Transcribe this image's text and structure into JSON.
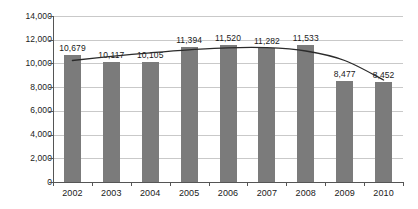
{
  "chart_data": {
    "type": "bar",
    "title": "",
    "xlabel": "",
    "ylabel": "",
    "categories": [
      "2002",
      "2003",
      "2004",
      "2005",
      "2006",
      "2007",
      "2008",
      "2009",
      "2010"
    ],
    "values": [
      10679,
      10117,
      10105,
      11394,
      11520,
      11282,
      11533,
      8477,
      8452
    ],
    "value_labels": [
      "10,679",
      "10,117",
      "10,105",
      "11,394",
      "11,520",
      "11,282",
      "11,533",
      "8,477",
      "8,452"
    ],
    "ylim": [
      0,
      14000
    ],
    "ytick_values": [
      14000,
      12000,
      10000,
      8000,
      6000,
      4000,
      2000,
      0
    ],
    "ytick_labels": [
      "14,000",
      "12,000",
      "10,000",
      "8,000",
      "6,000",
      "4,000",
      "2,000",
      "0"
    ],
    "grid": true,
    "legend": "none",
    "series": [
      {
        "name": "bars",
        "type": "bar",
        "color": "#7b7b7b",
        "values": [
          10679,
          10117,
          10105,
          11394,
          11520,
          11282,
          11533,
          8477,
          8452
        ]
      },
      {
        "name": "trend",
        "type": "line",
        "color": "#2b2b2b",
        "note": "smoothed polynomial trend curve drawn over the bars",
        "values": [
          10250,
          10600,
          10900,
          11150,
          11320,
          11330,
          11050,
          10250,
          8600
        ]
      }
    ],
    "colors": {
      "bar": "#7b7b7b",
      "trend_line": "#2b2b2b",
      "grid": "#c9c9c9",
      "axis": "#555555"
    }
  }
}
